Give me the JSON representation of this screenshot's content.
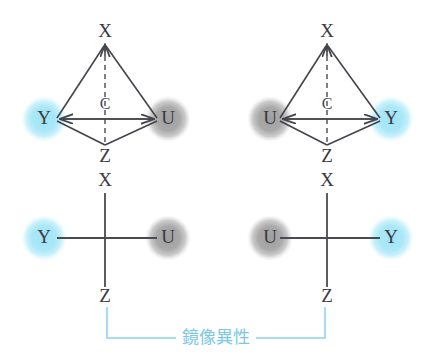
{
  "figure": {
    "background_color": "#ffffff",
    "bond_color": "#44444c",
    "label_color": "#3a3a42"
  },
  "colors": {
    "cyan_atom": "#aae8f7",
    "cyan_atom_core": "#9fe4f6",
    "gray_atom": "#a9a9a9",
    "gray_atom_core": "#a0a0a0",
    "bracket_blue": "#a8dcee",
    "text_blue": "#7cc7e8",
    "bond": "#44444c",
    "dashed_bond": "#55555d"
  },
  "structures": {
    "top_left": {
      "name": "tetrahedron-left",
      "type": "tetrahedral-wedge",
      "labels": {
        "apex": "X",
        "center": "C",
        "bottom": "Z",
        "left": "Y",
        "right": "U"
      },
      "left_atom_color": "cyan",
      "right_atom_color": "gray"
    },
    "top_right": {
      "name": "tetrahedron-right",
      "type": "tetrahedral-wedge",
      "labels": {
        "apex": "X",
        "center": "C",
        "bottom": "Z",
        "left": "U",
        "right": "Y"
      },
      "left_atom_color": "gray",
      "right_atom_color": "cyan"
    },
    "bottom_left": {
      "name": "fischer-left",
      "type": "cross-projection",
      "labels": {
        "top": "X",
        "bottom": "Z",
        "left": "Y",
        "right": "U"
      },
      "left_atom_color": "cyan",
      "right_atom_color": "gray"
    },
    "bottom_right": {
      "name": "fischer-right",
      "type": "cross-projection",
      "labels": {
        "top": "X",
        "bottom": "Z",
        "left": "U",
        "right": "Y"
      },
      "left_atom_color": "gray",
      "right_atom_color": "cyan"
    }
  },
  "annotation": {
    "mirror_label": "鏡像異性",
    "bracket_style": "square-bracket-upward-ends"
  }
}
